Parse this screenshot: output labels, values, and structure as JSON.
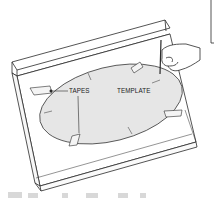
{
  "illustration": {
    "description": "Line drawing of an oval template taped onto a countertop with backsplash, a hand tracing the outline with a pencil",
    "labels": {
      "tapes": "TAPES",
      "template": "TEMPLATE"
    },
    "colors": {
      "background": "#ffffff",
      "line": "#2a2a2a",
      "template_fill": "#e6e6e6",
      "tape_fill": "#f4f4f4"
    }
  }
}
